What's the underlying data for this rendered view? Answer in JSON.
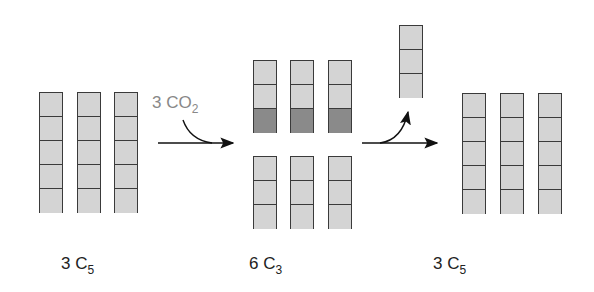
{
  "diagram": {
    "stages": [
      {
        "id": "start",
        "label_count": "3 C",
        "label_sub": "5",
        "columns": 3,
        "cells_per_column": 5
      },
      {
        "id": "middle",
        "label_count": "6 C",
        "label_sub": "3",
        "columns": 6,
        "cells_per_column": 3,
        "shaded_cells": "bottom cell of top three columns"
      },
      {
        "id": "end",
        "label_count": "3 C",
        "label_sub": "5",
        "columns": 3,
        "cells_per_column": 5
      }
    ],
    "input": {
      "label": "3 CO",
      "sub": "2"
    },
    "output": {
      "description": "one C3 column released",
      "cells": 3
    },
    "colors": {
      "cell": "#d4d4d4",
      "shaded_cell": "#8a8a8a",
      "border": "#3a3a3a",
      "input_text": "#888888",
      "arrow": "#111111"
    }
  }
}
